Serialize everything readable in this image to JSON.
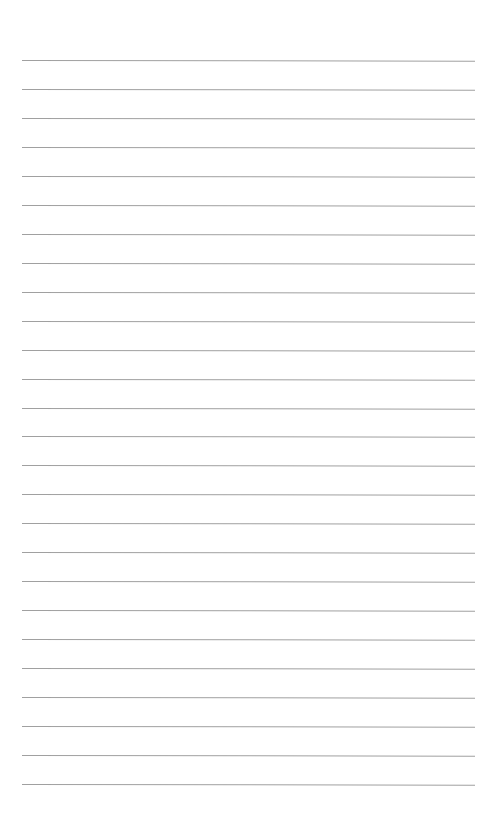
{
  "page": {
    "type": "lined-paper",
    "background_color": "#ffffff",
    "line_color": "#a0a0a0",
    "line_count": 26,
    "first_line_y": 60,
    "line_spacing": 28.96,
    "line_left_x": 22,
    "line_right_x": 475
  }
}
